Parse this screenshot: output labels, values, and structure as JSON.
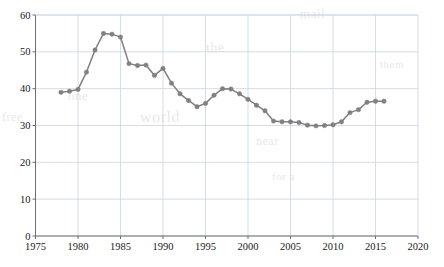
{
  "chart_data": {
    "type": "line",
    "title": "",
    "subtitle": "",
    "xlabel": "",
    "ylabel": "",
    "xlim": [
      1975,
      2020
    ],
    "ylim": [
      0,
      60
    ],
    "xticks": [
      1975,
      1980,
      1985,
      1990,
      1995,
      2000,
      2005,
      2010,
      2015,
      2020
    ],
    "yticks": [
      0,
      10,
      20,
      30,
      40,
      50,
      60
    ],
    "xtick_labels": [
      "1975",
      "1980",
      "1985",
      "1990",
      "1995",
      "2000",
      "2005",
      "2010",
      "2015",
      "2020"
    ],
    "ytick_labels": [
      "0",
      "10",
      "20",
      "30",
      "40",
      "50",
      "60"
    ],
    "grid": true,
    "legend": false,
    "legend_position": "none",
    "marker": "circle",
    "series": [
      {
        "name": "series-1",
        "color": "#808080",
        "x": [
          1978,
          1979,
          1980,
          1981,
          1982,
          1983,
          1984,
          1985,
          1986,
          1987,
          1988,
          1989,
          1990,
          1991,
          1992,
          1993,
          1994,
          1995,
          1996,
          1997,
          1998,
          1999,
          2000,
          2001,
          2002,
          2003,
          2004,
          2005,
          2006,
          2007,
          2008,
          2009,
          2010,
          2011,
          2012,
          2013,
          2014,
          2015,
          2016
        ],
        "values": [
          39.0,
          39.3,
          39.8,
          44.5,
          50.5,
          55.0,
          54.8,
          54.0,
          46.8,
          46.3,
          46.4,
          43.6,
          45.5,
          41.5,
          38.6,
          36.8,
          35.1,
          36.0,
          38.2,
          40.0,
          39.9,
          38.6,
          37.1,
          35.5,
          34.0,
          31.2,
          31.0,
          31.0,
          30.8,
          30.1,
          29.9,
          30.0,
          30.2,
          31.0,
          33.5,
          34.3,
          36.3,
          36.6,
          36.6
        ]
      }
    ]
  },
  "axes": {
    "frame_color": "#9aa3ad",
    "grid_color": "#c9d4e2",
    "tick_text_color": "#1a1a1a"
  },
  "watermarks": [
    {
      "text": "mail",
      "x": 300,
      "y": 6,
      "size": 13,
      "rot": -1
    },
    {
      "text": "the",
      "x": 206,
      "y": 40,
      "size": 14,
      "rot": -2
    },
    {
      "text": "one",
      "x": 68,
      "y": 88,
      "size": 13,
      "rot": 0
    },
    {
      "text": "world",
      "x": 140,
      "y": 108,
      "size": 16,
      "rot": -1
    },
    {
      "text": "free",
      "x": 2,
      "y": 110,
      "size": 12,
      "rot": 0
    },
    {
      "text": "near",
      "x": 256,
      "y": 134,
      "size": 12,
      "rot": 0
    },
    {
      "text": "for a",
      "x": 272,
      "y": 170,
      "size": 11,
      "rot": 0
    },
    {
      "text": "them",
      "x": 380,
      "y": 58,
      "size": 11,
      "rot": 0
    }
  ]
}
